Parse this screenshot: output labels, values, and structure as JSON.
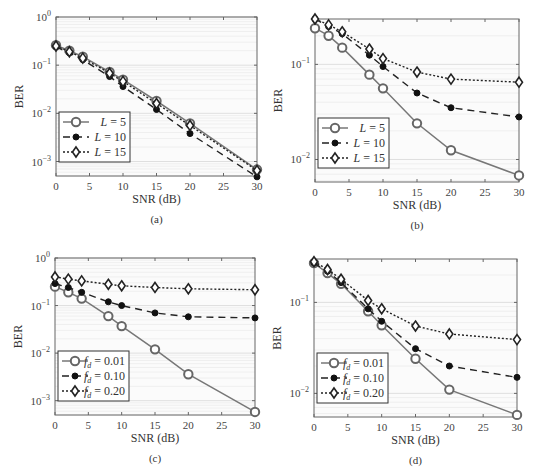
{
  "chart_data": [
    {
      "id": "a",
      "caption": "(a)",
      "type": "line",
      "xlabel": "SNR (dB)",
      "ylabel": "BER",
      "yscale": "log",
      "xlim": [
        0,
        30
      ],
      "ylim": [
        0.0005,
        1
      ],
      "xticks": [
        0,
        5,
        10,
        15,
        20,
        25,
        30
      ],
      "yticks": [
        "10^0",
        "10^-1",
        "10^-2",
        "10^-3"
      ],
      "grid": true,
      "legend_position": "lower left",
      "x": [
        0,
        2,
        4,
        8,
        10,
        15,
        20,
        30
      ],
      "series": [
        {
          "name": "L = 5",
          "style": "solid",
          "marker": "circle",
          "values": [
            0.26,
            0.2,
            0.15,
            0.072,
            0.05,
            0.018,
            0.0062,
            0.00068
          ]
        },
        {
          "name": "L = 10",
          "style": "dashed",
          "marker": "filled-dot",
          "values": [
            0.24,
            0.18,
            0.13,
            0.058,
            0.036,
            0.012,
            0.0038,
            0.00048
          ]
        },
        {
          "name": "L = 15",
          "style": "dotted",
          "marker": "diamond",
          "values": [
            0.25,
            0.19,
            0.14,
            0.068,
            0.046,
            0.016,
            0.0056,
            0.00065
          ]
        }
      ]
    },
    {
      "id": "b",
      "caption": "(b)",
      "type": "line",
      "xlabel": "SNR (dB)",
      "ylabel": "BER",
      "yscale": "log",
      "xlim": [
        0,
        30
      ],
      "ylim": [
        0.0058,
        0.3
      ],
      "xticks": [
        0,
        5,
        10,
        15,
        20,
        25,
        30
      ],
      "yticks": [
        "10^-1",
        "10^-2"
      ],
      "grid": true,
      "legend_position": "lower left",
      "x": [
        0,
        2,
        4,
        8,
        10,
        15,
        20,
        30
      ],
      "series": [
        {
          "name": "L = 5",
          "style": "solid",
          "marker": "circle",
          "values": [
            0.24,
            0.2,
            0.15,
            0.078,
            0.056,
            0.024,
            0.0125,
            0.0068
          ]
        },
        {
          "name": "L = 10",
          "style": "dashed",
          "marker": "filled-dot",
          "values": [
            0.3,
            0.25,
            0.21,
            0.125,
            0.095,
            0.05,
            0.035,
            0.028
          ]
        },
        {
          "name": "L = 15",
          "style": "dotted",
          "marker": "diamond",
          "values": [
            0.3,
            0.26,
            0.22,
            0.145,
            0.115,
            0.083,
            0.07,
            0.065
          ]
        }
      ]
    },
    {
      "id": "c",
      "caption": "(c)",
      "type": "line",
      "xlabel": "SNR (dB)",
      "ylabel": "BER",
      "yscale": "log",
      "xlim": [
        0,
        30
      ],
      "ylim": [
        0.0005,
        1
      ],
      "xticks": [
        0,
        5,
        10,
        15,
        20,
        25,
        30
      ],
      "yticks": [
        "10^0",
        "10^-1",
        "10^-2",
        "10^-3"
      ],
      "grid": true,
      "legend_position": "lower left",
      "x": [
        0,
        2,
        4,
        8,
        10,
        15,
        20,
        30
      ],
      "series": [
        {
          "name": "f_d = 0.01",
          "style": "solid",
          "marker": "circle",
          "values": [
            0.25,
            0.19,
            0.14,
            0.06,
            0.037,
            0.012,
            0.0036,
            0.00058
          ]
        },
        {
          "name": "f_d = 0.10",
          "style": "dashed",
          "marker": "filled-dot",
          "values": [
            0.29,
            0.24,
            0.19,
            0.12,
            0.1,
            0.07,
            0.058,
            0.055
          ]
        },
        {
          "name": "f_d = 0.20",
          "style": "dotted",
          "marker": "diamond",
          "values": [
            0.4,
            0.36,
            0.33,
            0.28,
            0.26,
            0.24,
            0.225,
            0.215
          ]
        }
      ]
    },
    {
      "id": "d",
      "caption": "(d)",
      "type": "line",
      "xlabel": "SNR (dB)",
      "ylabel": "BER",
      "yscale": "log",
      "xlim": [
        0,
        30
      ],
      "ylim": [
        0.0055,
        0.3
      ],
      "xticks": [
        0,
        5,
        10,
        15,
        20,
        25,
        30
      ],
      "yticks": [
        "10^-1",
        "10^-2"
      ],
      "grid": true,
      "legend_position": "lower left",
      "x": [
        0,
        2,
        4,
        8,
        10,
        15,
        20,
        30
      ],
      "series": [
        {
          "name": "f_d = 0.01",
          "style": "solid",
          "marker": "circle",
          "values": [
            0.27,
            0.21,
            0.16,
            0.08,
            0.056,
            0.024,
            0.011,
            0.0058
          ]
        },
        {
          "name": "f_d = 0.10",
          "style": "dashed",
          "marker": "filled-dot",
          "values": [
            0.27,
            0.22,
            0.165,
            0.085,
            0.062,
            0.031,
            0.02,
            0.015
          ]
        },
        {
          "name": "f_d = 0.20",
          "style": "dotted",
          "marker": "diamond",
          "values": [
            0.28,
            0.23,
            0.18,
            0.105,
            0.085,
            0.055,
            0.045,
            0.039
          ]
        }
      ]
    }
  ]
}
